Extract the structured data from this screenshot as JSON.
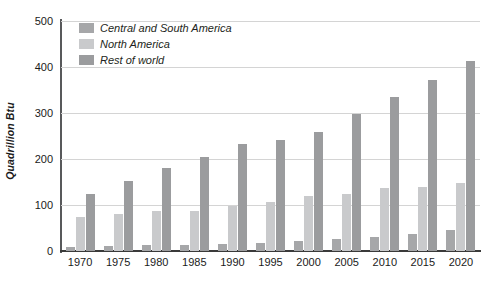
{
  "chart_data": {
    "type": "bar",
    "title": "",
    "xlabel": "",
    "ylabel": "Quadrillion Btu",
    "ylim": [
      0,
      500
    ],
    "yticks": [
      0,
      100,
      200,
      300,
      400,
      500
    ],
    "grid": true,
    "legend_position": "top-left",
    "categories": [
      "1970",
      "1975",
      "1980",
      "1985",
      "1990",
      "1995",
      "2000",
      "2005",
      "2010",
      "2015",
      "2020"
    ],
    "series": [
      {
        "name": "Central and South America",
        "color": "#a6a7a9",
        "values": [
          9,
          11,
          13,
          13,
          15,
          18,
          21,
          27,
          31,
          38,
          45
        ]
      },
      {
        "name": "North America",
        "color": "#c9cacc",
        "values": [
          75,
          80,
          88,
          87,
          98,
          106,
          119,
          125,
          136,
          140,
          147
        ]
      },
      {
        "name": "Rest of world",
        "color": "#9b9c9e",
        "values": [
          123,
          152,
          181,
          205,
          232,
          241,
          259,
          298,
          335,
          372,
          414
        ]
      }
    ]
  },
  "axes": {
    "y_title": "Quadrillion Btu"
  }
}
